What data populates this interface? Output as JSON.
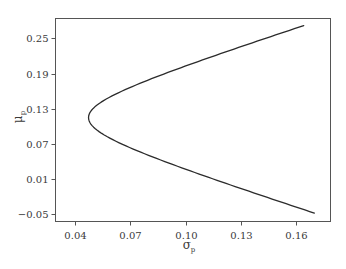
{
  "chart_data": {
    "type": "line",
    "title": "",
    "xlabel": "σ_p",
    "ylabel": "μ_p",
    "xlabel_main": "σ",
    "xlabel_sub": "p",
    "ylabel_main": "μ",
    "ylabel_sub": "p",
    "xlim": [
      0.0295,
      0.1785
    ],
    "ylim": [
      -0.0623,
      0.2841
    ],
    "grid": false,
    "legend": null,
    "x_ticks": [
      0.04,
      0.07,
      0.1,
      0.13,
      0.16
    ],
    "x_tick_labels": [
      "0.04",
      "0.07",
      "0.10",
      "0.13",
      "0.16"
    ],
    "y_ticks": [
      0.25,
      0.19,
      0.13,
      0.07,
      0.01,
      -0.05
    ],
    "y_tick_labels": [
      "0.25",
      "0.19",
      "0.13",
      "0.07",
      "0.01",
      "−0.05"
    ],
    "series": [
      {
        "name": "efficient frontier",
        "color": "#2b2b2b",
        "x": [
          0.164,
          0.1431,
          0.1152,
          0.0887,
          0.0654,
          0.0497,
          0.0474,
          0.0497,
          0.0654,
          0.0887,
          0.1152,
          0.1431,
          0.1698
        ],
        "y": [
          0.272,
          0.25,
          0.22,
          0.19,
          0.16,
          0.13,
          0.115,
          0.1,
          0.07,
          0.04,
          0.01,
          -0.02,
          -0.048
        ]
      }
    ],
    "curve_model": {
      "form": "sigma = sqrt((mu - mu0)^2 + sigma0^2)",
      "mu0": 0.115,
      "sigma0": 0.0474,
      "mu_range": [
        -0.048,
        0.272
      ]
    }
  },
  "colors": {
    "frame": "#555555",
    "curve": "#2b2b2b",
    "text": "#3a3a3a",
    "background": "#ffffff"
  }
}
